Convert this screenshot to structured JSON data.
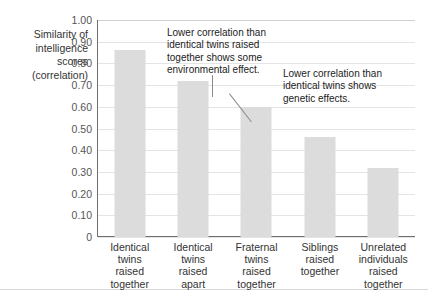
{
  "chart_data": {
    "type": "bar",
    "title": "",
    "xlabel": "",
    "ylabel": "Similarity of intelligence scores (correlation)",
    "ylim": [
      0,
      1.0
    ],
    "grid": true,
    "legend": "none",
    "categories": [
      "Identical\ntwins\nraised\ntogether",
      "Identical\ntwins\nraised\napart",
      "Fraternal\ntwins\nraised\ntogether",
      "Siblings\nraised\ntogether",
      "Unrelated\nindividuals\nraised\ntogether"
    ],
    "values": [
      0.86,
      0.72,
      0.6,
      0.46,
      0.32
    ],
    "ytick_labels": [
      "1.00",
      "0.90",
      "0.80",
      "0.70",
      "0.60",
      "0.50",
      "0.40",
      "0.30",
      "0.20",
      "0.10",
      "0"
    ],
    "ytick_values": [
      1.0,
      0.9,
      0.8,
      0.7,
      0.6,
      0.5,
      0.4,
      0.3,
      0.2,
      0.1,
      0
    ],
    "bar_color": "#dcdcdc",
    "gridline_color": "#e4e4e4",
    "axis_color": "#6e6e6e",
    "annotations": [
      {
        "text": "Lower correlation than\nidentical twins raised\ntogether shows some\nenvironmental effect.",
        "points_to_category": "Identical twins raised apart"
      },
      {
        "text": "Lower correlation than\nidentical twins shows\ngenetic effects.",
        "points_to_category": "Fraternal twins raised together"
      }
    ]
  },
  "axis_title": {
    "line1": "Similarity of",
    "line2": "intelligence",
    "line3": "scores",
    "line4": "(correlation)"
  }
}
